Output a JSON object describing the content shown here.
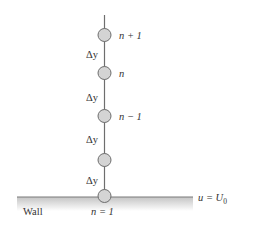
{
  "diagram": {
    "type": "finite-difference-grid",
    "nodes": [
      {
        "id": "n_plus_1",
        "label": "n + 1",
        "y": 35
      },
      {
        "id": "n",
        "label": "n",
        "y": 73
      },
      {
        "id": "n_minus_1",
        "label": "n − 1",
        "y": 116
      },
      {
        "id": "n_2",
        "label": "",
        "y": 160
      },
      {
        "id": "n_1",
        "label": "n = 1",
        "y": 196
      }
    ],
    "spacing_labels": [
      {
        "text": "Δy",
        "y": 55
      },
      {
        "text": "Δy",
        "y": 98
      },
      {
        "text": "Δy",
        "y": 140
      },
      {
        "text": "Δy",
        "y": 181
      }
    ],
    "wall": {
      "label": "Wall",
      "boundary_condition_left": "u = U",
      "boundary_condition_subscript": "0"
    },
    "colors": {
      "node_fill": "#d4d4d4",
      "node_stroke": "#6e6e6e",
      "line": "#6e6e6e",
      "wall_top": "#7a7a7a",
      "wall_gradient_start": "#c8c8c8",
      "wall_gradient_end": "#ffffff",
      "text": "#333333"
    }
  }
}
